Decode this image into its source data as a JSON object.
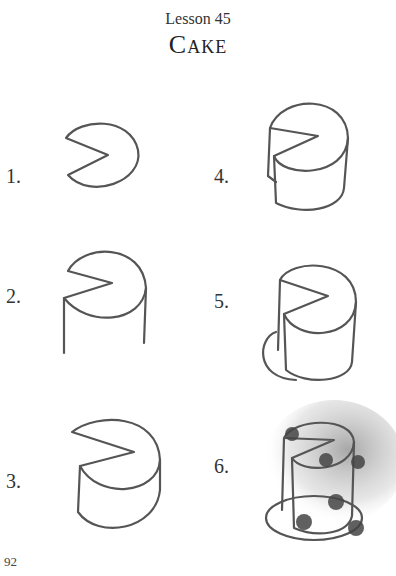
{
  "header": {
    "lesson": "Lesson 45",
    "title": "Cake"
  },
  "steps": [
    {
      "number": "1."
    },
    {
      "number": "2."
    },
    {
      "number": "3."
    },
    {
      "number": "4."
    },
    {
      "number": "5."
    },
    {
      "number": "6."
    }
  ],
  "footer": {
    "page_number": "92"
  }
}
